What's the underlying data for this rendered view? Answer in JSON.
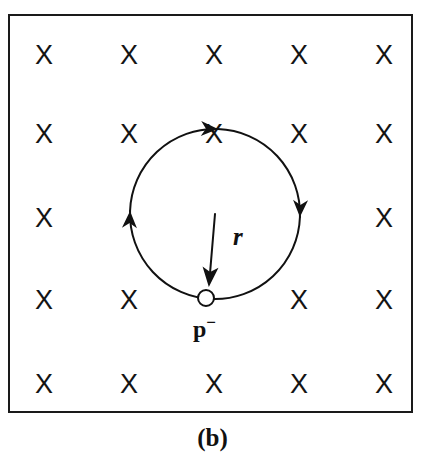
{
  "figure": {
    "caption": "(b)",
    "panel_id": "b",
    "description_type": "physics-diagram"
  },
  "field": {
    "symbol": "X",
    "meaning": "magnetic-field-into-page",
    "rows": 5,
    "columns": 5,
    "row_y": [
      53,
      132,
      216,
      298,
      382
    ],
    "column_x": [
      42,
      127,
      212,
      297,
      382
    ],
    "hidden_cells": [
      {
        "row": 2,
        "col": 1
      },
      {
        "row": 2,
        "col": 2
      },
      {
        "row": 2,
        "col": 3
      },
      {
        "row": 3,
        "col": 2
      }
    ],
    "color": "#141414"
  },
  "boundary": {
    "x": 8,
    "y": 14,
    "width": 405,
    "height": 399,
    "stroke": "#1a1a1a",
    "stroke_width": 2
  },
  "orbit": {
    "center_x": 215,
    "center_y": 214,
    "radius": 85,
    "stroke": "#111111",
    "stroke_width": 2,
    "direction": "clockwise",
    "arrow_angles_deg": [
      272,
      2,
      182
    ]
  },
  "radius_indicator": {
    "label": "r",
    "from_x": 215,
    "from_y": 214,
    "to_x": 208,
    "to_y": 297,
    "stroke": "#111111"
  },
  "particle": {
    "label": "p",
    "charge_sign": "−",
    "display_label": "p⁻",
    "x": 206,
    "y": 298,
    "radius": 8,
    "fill": "#ffffff",
    "stroke": "#111111"
  }
}
